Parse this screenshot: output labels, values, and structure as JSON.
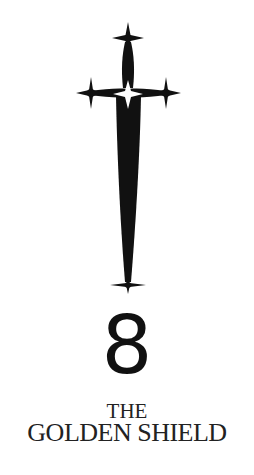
{
  "cover": {
    "numeral": "8",
    "title_line1": "THE",
    "title_line2": "GOLDEN SHIELD",
    "emblem": "sword-icon",
    "colors": {
      "background": "#ffffff",
      "ink": "#111111",
      "title": "#222222"
    }
  }
}
